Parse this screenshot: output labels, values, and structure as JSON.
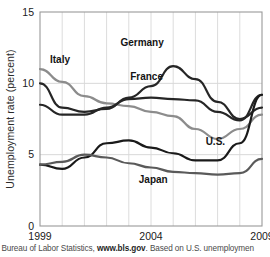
{
  "figure": {
    "source_note_prefix": "rce: Bureau of Labor Statistics, ",
    "source_note_link": "www.bls.gov",
    "source_note_suffix": ". Based on U.S. unemploymen"
  },
  "chart_data": {
    "type": "line",
    "title": "",
    "xlabel": "",
    "ylabel": "Unemployment rate (percent)",
    "xlim": [
      1999,
      2009
    ],
    "ylim": [
      0,
      15
    ],
    "yticks": [
      0,
      5,
      10,
      15
    ],
    "ytick_labels": [
      "0",
      "5",
      "10",
      "15"
    ],
    "xticks": [
      1999,
      2004,
      2009
    ],
    "xtick_labels": [
      "1999",
      "2004",
      "2009"
    ],
    "grid": "vertical-minor-yearly",
    "legend": "inline-series-labels",
    "x": [
      1999,
      2000,
      2001,
      2002,
      2003,
      2004,
      2005,
      2006,
      2007,
      2008,
      2009
    ],
    "series": [
      {
        "name": "Italy",
        "color": "#8c8c8c",
        "label_x": 1999.9,
        "label_y": 11.4,
        "values": [
          11.0,
          10.1,
          9.1,
          8.6,
          8.4,
          8.0,
          7.7,
          6.8,
          6.1,
          6.8,
          7.8
        ]
      },
      {
        "name": "Germany",
        "color": "#262626",
        "label_x": 2003.6,
        "label_y": 12.6,
        "values": [
          10.0,
          8.3,
          8.0,
          8.2,
          9.0,
          9.8,
          11.2,
          10.3,
          8.7,
          7.5,
          8.3
        ]
      },
      {
        "name": "France",
        "color": "#262626",
        "label_x": 2003.8,
        "label_y": 10.2,
        "values": [
          8.5,
          7.8,
          7.8,
          8.3,
          8.9,
          9.0,
          8.9,
          8.8,
          8.0,
          7.4,
          9.2
        ]
      },
      {
        "name": "U.S.",
        "color": "#1a1a1a",
        "label_x": 2006.9,
        "label_y": 5.7,
        "values": [
          4.3,
          4.0,
          4.8,
          5.8,
          6.0,
          5.5,
          5.1,
          4.6,
          4.6,
          5.8,
          9.2
        ]
      },
      {
        "name": "Japan",
        "color": "#5a5a5a",
        "label_x": 2004.1,
        "label_y": 3.0,
        "values": [
          4.3,
          4.5,
          5.0,
          4.8,
          4.4,
          4.1,
          3.8,
          3.7,
          3.6,
          3.7,
          4.7
        ]
      }
    ]
  }
}
